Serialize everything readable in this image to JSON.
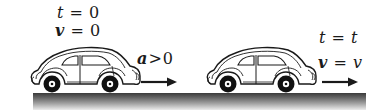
{
  "diagram": {
    "title": "",
    "ground": {
      "color_top": "#3a3a3a",
      "color_bottom": "#ececec"
    },
    "initial_state": {
      "time_label": {
        "variable": "t",
        "operator": "=",
        "value": "0"
      },
      "velocity_label": {
        "variable": "v",
        "operator": "=",
        "value": "0"
      },
      "acceleration_label": {
        "variable": "a",
        "operator": ">",
        "value": "0"
      },
      "arrow": "right-arrow"
    },
    "final_state": {
      "time_label": {
        "variable": "t",
        "operator": "=",
        "value": "t"
      },
      "velocity_label": {
        "variable": "v",
        "operator": "=",
        "value": "v"
      },
      "arrow": "right-arrow"
    },
    "colors": {
      "stroke": "#1a1a1a",
      "fill": "#ffffff"
    }
  }
}
